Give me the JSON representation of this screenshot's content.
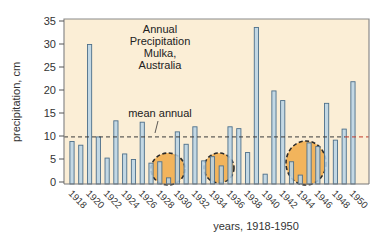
{
  "chart_data": {
    "type": "bar",
    "title_lines": [
      "Annual",
      "Precipitation",
      "Mulka,",
      "Australia"
    ],
    "xlabel": "years, 1918-1950",
    "ylabel": "precipitation, cm",
    "ylim": [
      0,
      35
    ],
    "yticks": [
      0,
      5,
      10,
      15,
      20,
      25,
      30,
      35
    ],
    "xtick_labels": [
      "1918",
      "1920",
      "1922",
      "1924",
      "1926",
      "1928",
      "1930",
      "1932",
      "1934",
      "1936",
      "1938",
      "1940",
      "1942",
      "1944",
      "1946",
      "1948",
      "1950"
    ],
    "categories": [
      "1918",
      "1919",
      "1920",
      "1921",
      "1922",
      "1923",
      "1924",
      "1925",
      "1926",
      "1927",
      "1928",
      "1929",
      "1930",
      "1931",
      "1932",
      "1933",
      "1934",
      "1935",
      "1936",
      "1937",
      "1938",
      "1939",
      "1940",
      "1941",
      "1942",
      "1943",
      "1944",
      "1945",
      "1946",
      "1947",
      "1948",
      "1949",
      "1950"
    ],
    "values": [
      8.8,
      8.0,
      29.9,
      9.8,
      5.2,
      13.3,
      6.1,
      4.9,
      13.0,
      4.1,
      4.4,
      0.9,
      10.9,
      8.2,
      12.0,
      4.6,
      5.5,
      3.5,
      12.0,
      11.6,
      6.4,
      33.6,
      1.7,
      19.8,
      17.7,
      4.4,
      1.5,
      8.5,
      7.7,
      17.1,
      9.1,
      11.5,
      21.8
    ],
    "reference_line": {
      "label": "mean annual",
      "value": 9.8,
      "style": "dashed"
    },
    "highlighted_periods": [
      {
        "label": "drought",
        "years": [
          "1927",
          "1928",
          "1929"
        ]
      },
      {
        "label": "drought",
        "years": [
          "1933",
          "1934",
          "1935"
        ]
      },
      {
        "label": "drought",
        "years": [
          "1943",
          "1944",
          "1945",
          "1946"
        ]
      }
    ],
    "grid": false,
    "legend": null
  },
  "colors": {
    "plot_background": "#fbeed6",
    "bar_fill": "#b9d3e6",
    "bar_stroke": "#4d6f8a",
    "blob_fill": "#f2b45c",
    "blob_stroke": "#2a2a2a",
    "mean_line": "#3a3a3a",
    "mean_line_tail": "#c0392b",
    "frame": "#8a8a8a"
  }
}
